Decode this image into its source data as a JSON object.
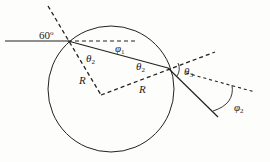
{
  "diagram": {
    "colors": {
      "stroke": "#222222",
      "background": "#fdfdfb"
    },
    "labels": {
      "incidence_angle": "60",
      "incidence_angle_unit": "o",
      "phi1": "φ",
      "phi1_sub": "1",
      "theta2_entry": "θ",
      "theta2_entry_sub": "2",
      "theta2_exit": "θ",
      "theta2_exit_sub": "2",
      "theta3": "θ",
      "theta3_sub": "3",
      "phi2": "φ",
      "phi2_sub": "2",
      "radius_1": "R",
      "radius_2": "R"
    }
  }
}
